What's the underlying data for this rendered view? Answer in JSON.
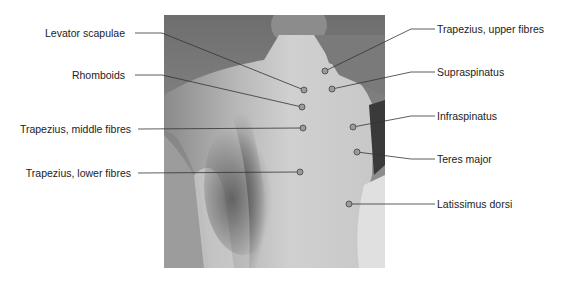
{
  "figure": {
    "marker_color": "#9a9a9a",
    "line_color": "#333333"
  },
  "labels_left": [
    {
      "text": "Levator scapulae",
      "label_x": 125,
      "label_y": 33,
      "line": [
        [
          135,
          33
        ],
        [
          162,
          33
        ],
        [
          304,
          90
        ]
      ]
    },
    {
      "text": "Rhomboids",
      "label_x": 125,
      "label_y": 75,
      "line": [
        [
          135,
          75
        ],
        [
          162,
          75
        ],
        [
          302,
          107
        ]
      ]
    },
    {
      "text": "Trapezius, middle fibres",
      "label_x": 131,
      "label_y": 129,
      "line": [
        [
          138,
          129
        ],
        [
          303,
          128
        ]
      ]
    },
    {
      "text": "Trapezius, lower fibres",
      "label_x": 131,
      "label_y": 173,
      "line": [
        [
          138,
          173
        ],
        [
          300,
          172
        ]
      ]
    }
  ],
  "labels_right": [
    {
      "text": "Trapezius, upper fibres",
      "label_x": 437,
      "label_y": 29,
      "line": [
        [
          325,
          71
        ],
        [
          411,
          29
        ],
        [
          435,
          29
        ]
      ]
    },
    {
      "text": "Supraspinatus",
      "label_x": 437,
      "label_y": 72,
      "line": [
        [
          332,
          89
        ],
        [
          411,
          72
        ],
        [
          435,
          72
        ]
      ]
    },
    {
      "text": "Infraspinatus",
      "label_x": 437,
      "label_y": 116,
      "line": [
        [
          353,
          127
        ],
        [
          411,
          116
        ],
        [
          435,
          116
        ]
      ]
    },
    {
      "text": "Teres major",
      "label_x": 437,
      "label_y": 159,
      "line": [
        [
          357,
          152
        ],
        [
          411,
          159
        ],
        [
          435,
          159
        ]
      ]
    },
    {
      "text": "Latissimus dorsi",
      "label_x": 437,
      "label_y": 204,
      "line": [
        [
          349,
          204
        ],
        [
          435,
          204
        ]
      ]
    }
  ],
  "markers": [
    {
      "name": "levator-scapulae",
      "x": 304,
      "y": 90
    },
    {
      "name": "trapezius-upper",
      "x": 325,
      "y": 71
    },
    {
      "name": "supraspinatus",
      "x": 332,
      "y": 89
    },
    {
      "name": "rhomboids",
      "x": 302,
      "y": 107
    },
    {
      "name": "trapezius-middle",
      "x": 303,
      "y": 128
    },
    {
      "name": "infraspinatus",
      "x": 353,
      "y": 127
    },
    {
      "name": "teres-major",
      "x": 357,
      "y": 152
    },
    {
      "name": "trapezius-lower",
      "x": 300,
      "y": 172
    },
    {
      "name": "latissimus-dorsi",
      "x": 349,
      "y": 204
    }
  ]
}
